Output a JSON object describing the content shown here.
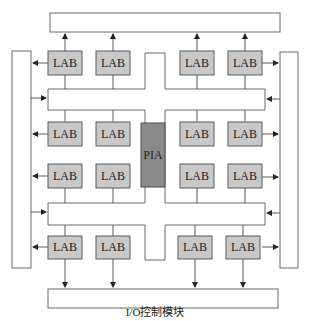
{
  "diagram": {
    "type": "CPLD architecture block diagram",
    "caption": "I/O控制模块",
    "center_block": "PIA",
    "lab_label": "LAB",
    "labs": [
      {
        "id": "lab-r1c1",
        "label": "LAB"
      },
      {
        "id": "lab-r1c2",
        "label": "LAB"
      },
      {
        "id": "lab-r1c3",
        "label": "LAB"
      },
      {
        "id": "lab-r1c4",
        "label": "LAB"
      },
      {
        "id": "lab-r2c1",
        "label": "LAB"
      },
      {
        "id": "lab-r2c2",
        "label": "LAB"
      },
      {
        "id": "lab-r2c3",
        "label": "LAB"
      },
      {
        "id": "lab-r2c4",
        "label": "LAB"
      },
      {
        "id": "lab-r3c1",
        "label": "LAB"
      },
      {
        "id": "lab-r3c2",
        "label": "LAB"
      },
      {
        "id": "lab-r3c3",
        "label": "LAB"
      },
      {
        "id": "lab-r3c4",
        "label": "LAB"
      },
      {
        "id": "lab-r4c1",
        "label": "LAB"
      },
      {
        "id": "lab-r4c2",
        "label": "LAB"
      },
      {
        "id": "lab-r4c3",
        "label": "LAB"
      },
      {
        "id": "lab-r4c4",
        "label": "LAB"
      }
    ],
    "io_blocks": [
      "top",
      "bottom",
      "left",
      "right"
    ],
    "colors": {
      "lab_fill": "#c8c8c8",
      "pia_fill": "#8a8a8a",
      "stroke": "#5a5a5a"
    }
  }
}
